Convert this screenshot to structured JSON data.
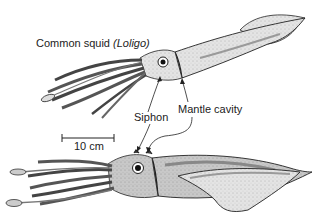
{
  "figure": {
    "title": "Common squid",
    "genus": "(Loligo)",
    "labels": {
      "siphon": "Siphon",
      "mantle_cavity": "Mantle cavity"
    },
    "scale_bar": {
      "label": "10 cm"
    },
    "colors": {
      "ink": "#1a1a1a",
      "body_light": "#e2e2e2",
      "body_mid": "#bdbdbd",
      "body_dark": "#8a8a8a",
      "background": "#ffffff"
    }
  }
}
